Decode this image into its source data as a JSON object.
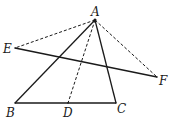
{
  "diagram": {
    "type": "geometry",
    "points": {
      "A": {
        "x": 95,
        "y": 20,
        "label": "A",
        "lx": 91,
        "ly": 16
      },
      "B": {
        "x": 15,
        "y": 103,
        "label": "B",
        "lx": 6,
        "ly": 117
      },
      "C": {
        "x": 116,
        "y": 103,
        "label": "C",
        "lx": 117,
        "ly": 113
      },
      "D": {
        "x": 68,
        "y": 103,
        "label": "D",
        "lx": 63,
        "ly": 117
      },
      "E": {
        "x": 15,
        "y": 48,
        "label": "E",
        "lx": 3,
        "ly": 53
      },
      "F": {
        "x": 157,
        "y": 77,
        "label": "F",
        "lx": 159,
        "ly": 85
      }
    },
    "segments": [
      {
        "from": "A",
        "to": "B",
        "style": "solid"
      },
      {
        "from": "A",
        "to": "C",
        "style": "solid"
      },
      {
        "from": "B",
        "to": "C",
        "style": "solid"
      },
      {
        "from": "E",
        "to": "F",
        "style": "solid"
      },
      {
        "from": "A",
        "to": "D",
        "style": "dashed"
      },
      {
        "from": "A",
        "to": "E",
        "style": "dashed"
      },
      {
        "from": "A",
        "to": "F",
        "style": "dashed"
      }
    ]
  }
}
